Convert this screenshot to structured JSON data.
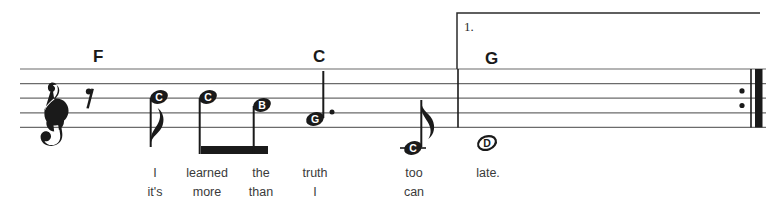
{
  "sheet": {
    "title": "",
    "clef": "treble-clef",
    "staff": {
      "line_count": 5,
      "top_y": 69,
      "line_spacing": 14.6,
      "left_x": 20,
      "right_x": 766,
      "line_color": "#6b6b6b"
    },
    "chords": [
      {
        "label": "F",
        "x": 93,
        "y": 48
      },
      {
        "label": "C",
        "x": 313,
        "y": 48
      },
      {
        "label": "G",
        "x": 485,
        "y": 50
      }
    ],
    "endings": [
      {
        "label": "1.",
        "x": 464,
        "y": 20,
        "bracket_start_x": 457,
        "bracket_end_x": 760,
        "bracket_top_y": 13
      }
    ],
    "barlines": [
      {
        "type": "single",
        "x": 458
      },
      {
        "type": "end-repeat",
        "x": 742
      }
    ],
    "rests": [
      {
        "type": "eighth-rest",
        "x": 92,
        "y": 96
      }
    ],
    "notes": [
      {
        "letter": "C",
        "x": 159,
        "y": 97,
        "duration": "eighth",
        "stem": "down",
        "flag": true,
        "beamed": false,
        "filled": true,
        "dotted": false,
        "ledger": false
      },
      {
        "letter": "C",
        "x": 208,
        "y": 97,
        "duration": "eighth",
        "stem": "down",
        "flag": false,
        "beamed": true,
        "filled": true,
        "dotted": false,
        "ledger": false
      },
      {
        "letter": "B",
        "x": 262,
        "y": 105,
        "duration": "eighth",
        "stem": "down",
        "flag": false,
        "beamed": true,
        "filled": true,
        "dotted": false,
        "ledger": false
      },
      {
        "letter": "G",
        "x": 315,
        "y": 119,
        "duration": "quarter-dotted",
        "stem": "up",
        "flag": false,
        "beamed": false,
        "filled": true,
        "dotted": true,
        "ledger": false
      },
      {
        "letter": "C",
        "x": 413,
        "y": 148,
        "duration": "eighth",
        "stem": "up",
        "flag": true,
        "beamed": false,
        "filled": true,
        "dotted": false,
        "ledger": true
      },
      {
        "letter": "D",
        "x": 487,
        "y": 143,
        "duration": "whole",
        "stem": "none",
        "flag": false,
        "beamed": false,
        "filled": false,
        "dotted": false,
        "ledger": false
      }
    ],
    "beams": [
      {
        "from_x": 201,
        "to_x": 268,
        "y": 146,
        "thickness": 8
      }
    ],
    "lyrics": {
      "verse_1": [
        {
          "text": "I",
          "x": 155
        },
        {
          "text": "learned",
          "x": 207
        },
        {
          "text": "the",
          "x": 261
        },
        {
          "text": "truth",
          "x": 315
        },
        {
          "text": "too",
          "x": 414
        },
        {
          "text": "late.",
          "x": 488
        }
      ],
      "verse_2": [
        {
          "text": "it's",
          "x": 155
        },
        {
          "text": "more",
          "x": 207
        },
        {
          "text": "than",
          "x": 261
        },
        {
          "text": "I",
          "x": 315
        },
        {
          "text": "can",
          "x": 414
        }
      ],
      "verse_1_y": 167,
      "verse_2_y": 186
    },
    "colors": {
      "ink": "#1a1a1a",
      "staff_line": "#6b6b6b",
      "lyric_text": "#3a3a3a",
      "background": "#ffffff"
    }
  }
}
